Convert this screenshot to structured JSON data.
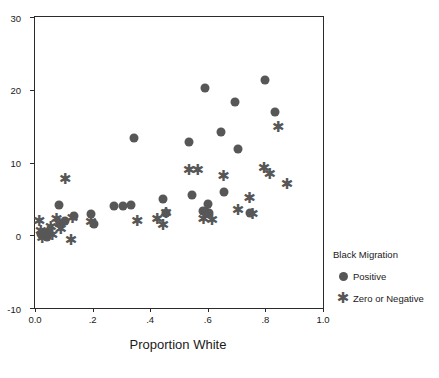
{
  "chart_data": {
    "type": "scatter",
    "title": "",
    "xlabel": "Proportion White",
    "ylabel": "",
    "xlim": [
      0.0,
      1.0
    ],
    "ylim": [
      -10,
      30
    ],
    "xticks": [
      0.0,
      0.2,
      0.4,
      0.6,
      0.8,
      1.0
    ],
    "xtick_labels": [
      "0.0",
      ".2",
      ".4",
      ".6",
      ".8",
      "1.0"
    ],
    "yticks": [
      -10,
      0,
      10,
      20,
      30
    ],
    "ytick_labels": [
      "-10",
      "0",
      "10",
      "20",
      "30"
    ],
    "grid": false,
    "legend_position": "right",
    "legend_title": "Black Migration",
    "marker_color": "#575757",
    "axis_color": "#2b2b2b",
    "series": [
      {
        "name": "Positive",
        "marker": "circle",
        "points": [
          [
            0.02,
            0.2
          ],
          [
            0.03,
            0.0
          ],
          [
            0.04,
            -0.2
          ],
          [
            0.05,
            0.3
          ],
          [
            0.085,
            4.1
          ],
          [
            0.105,
            2.0
          ],
          [
            0.135,
            2.6
          ],
          [
            0.195,
            2.9
          ],
          [
            0.205,
            1.5
          ],
          [
            0.275,
            4.0
          ],
          [
            0.305,
            4.0
          ],
          [
            0.335,
            4.2
          ],
          [
            0.345,
            13.3
          ],
          [
            0.445,
            5.0
          ],
          [
            0.455,
            3.1
          ],
          [
            0.535,
            12.8
          ],
          [
            0.545,
            5.6
          ],
          [
            0.585,
            3.3
          ],
          [
            0.595,
            3.2
          ],
          [
            0.6,
            4.3
          ],
          [
            0.605,
            3.0
          ],
          [
            0.59,
            20.2
          ],
          [
            0.645,
            14.2
          ],
          [
            0.655,
            6.0
          ],
          [
            0.695,
            18.3
          ],
          [
            0.705,
            11.9
          ],
          [
            0.745,
            3.1
          ],
          [
            0.8,
            21.3
          ],
          [
            0.835,
            17.0
          ]
        ]
      },
      {
        "name": "Zero or Negative",
        "marker": "asterisk",
        "points": [
          [
            0.015,
            1.9
          ],
          [
            0.02,
            0.6
          ],
          [
            0.025,
            -0.4
          ],
          [
            0.03,
            0.1
          ],
          [
            0.045,
            0.4
          ],
          [
            0.055,
            1.2
          ],
          [
            0.06,
            0.0
          ],
          [
            0.075,
            2.2
          ],
          [
            0.085,
            1.5
          ],
          [
            0.09,
            0.9
          ],
          [
            0.105,
            7.7
          ],
          [
            0.125,
            -0.7
          ],
          [
            0.13,
            2.4
          ],
          [
            0.195,
            1.8
          ],
          [
            0.355,
            2.0
          ],
          [
            0.425,
            2.2
          ],
          [
            0.445,
            1.4
          ],
          [
            0.455,
            3.1
          ],
          [
            0.535,
            9.0
          ],
          [
            0.565,
            9.0
          ],
          [
            0.585,
            2.3
          ],
          [
            0.615,
            2.1
          ],
          [
            0.655,
            8.2
          ],
          [
            0.705,
            3.5
          ],
          [
            0.745,
            5.1
          ],
          [
            0.755,
            2.9
          ],
          [
            0.795,
            9.3
          ],
          [
            0.815,
            8.4
          ],
          [
            0.845,
            14.9
          ],
          [
            0.875,
            7.0
          ]
        ]
      }
    ]
  }
}
